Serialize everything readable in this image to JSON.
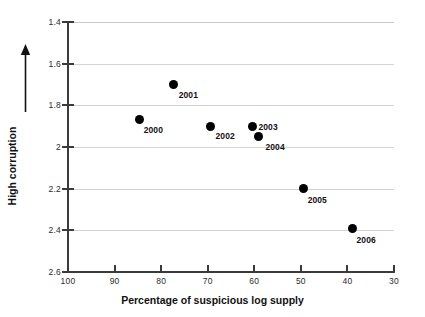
{
  "chart_data": {
    "type": "scatter",
    "title": "",
    "xlabel": "Percentage of suspicious log supply",
    "ylabel": "High corruption",
    "ylabel_arrow": "up-arrow",
    "xlim": [
      100,
      30
    ],
    "ylim": [
      2.6,
      1.4
    ],
    "x_axis_reversed": true,
    "y_axis_reversed": true,
    "grid": "horizontal",
    "legend": "none",
    "x_ticks": [
      "100",
      "90",
      "80",
      "70",
      "60",
      "50",
      "40",
      "30"
    ],
    "x_tick_values": [
      100,
      90,
      80,
      70,
      60,
      50,
      40,
      30
    ],
    "y_ticks": [
      "1.4",
      "1.6",
      "1.8",
      "2",
      "2.2",
      "2.4",
      "2.6"
    ],
    "y_tick_values": [
      1.4,
      1.6,
      1.8,
      2.0,
      2.2,
      2.4,
      2.6
    ],
    "point_color": "#000000",
    "grid_color": "#d4d4d4",
    "axis_color": "#3a3a3a",
    "points": [
      {
        "label": "2000",
        "x": 84.6,
        "y": 1.87,
        "label_dx": 4,
        "label_dy": 5
      },
      {
        "label": "2001",
        "x": 77.3,
        "y": 1.7,
        "label_dx": 5,
        "label_dy": 5
      },
      {
        "label": "2002",
        "x": 69.4,
        "y": 1.9,
        "label_dx": 5,
        "label_dy": 5
      },
      {
        "label": "2003",
        "x": 60.4,
        "y": 1.9,
        "label_dx": 6,
        "label_dy": -4
      },
      {
        "label": "2004",
        "x": 59.1,
        "y": 1.95,
        "label_dx": 7,
        "label_dy": 5
      },
      {
        "label": "2005",
        "x": 49.4,
        "y": 2.2,
        "label_dx": 4,
        "label_dy": 6
      },
      {
        "label": "2006",
        "x": 38.9,
        "y": 2.39,
        "label_dx": 4,
        "label_dy": 7
      }
    ]
  }
}
